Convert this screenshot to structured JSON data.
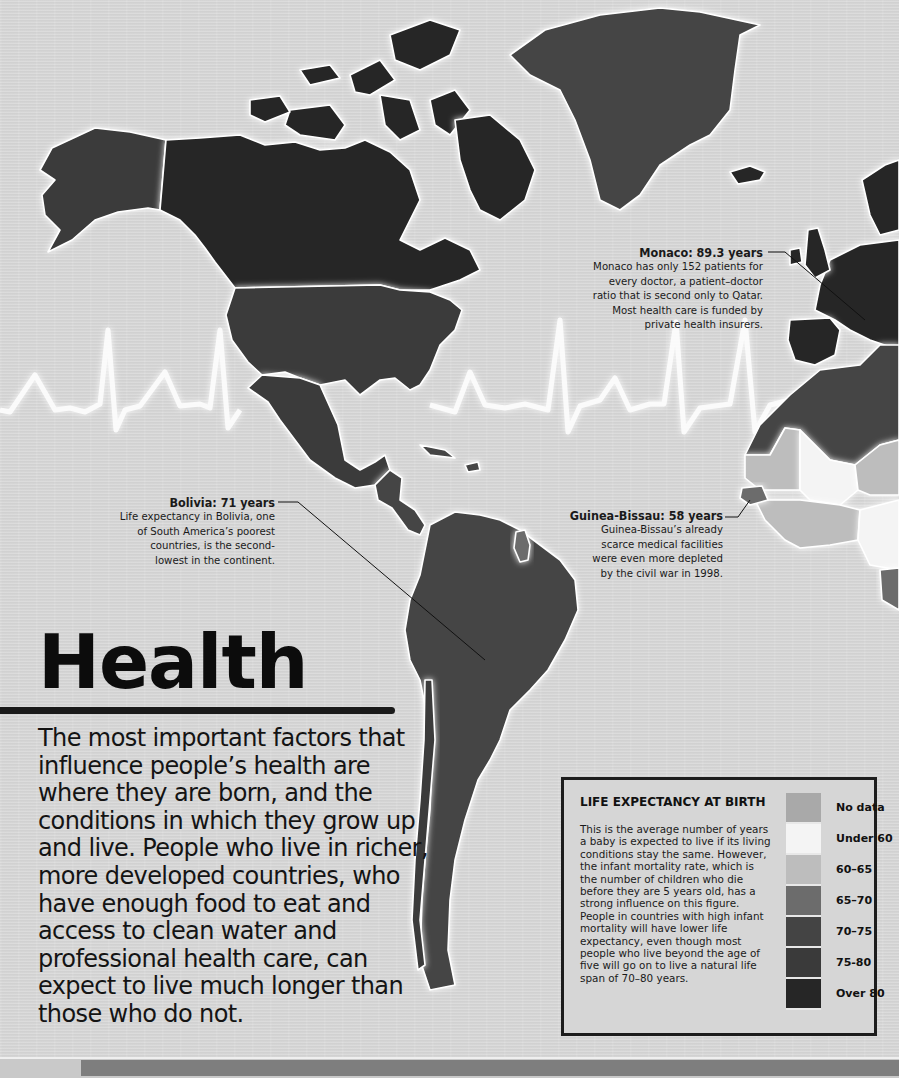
{
  "page": {
    "title": "Health",
    "intro": "The most important factors that influence people’s health are where they are born, and the conditions in which they grow up and live. People who live in richer, more developed countries, who have enough food to eat and access to clean water and professional health care, can expect to live much longer than those who do not."
  },
  "annotations": [
    {
      "id": "monaco",
      "title": "Monaco: 89.3 years",
      "lines": [
        "Monaco has only 152 patients for",
        "every doctor, a patient–doctor",
        "ratio that is second only to Qatar.",
        "Most health care is funded by",
        "private health insurers."
      ]
    },
    {
      "id": "bolivia",
      "title": "Bolivia: 71 years",
      "lines": [
        "Life expectancy in Bolivia, one",
        "of South America’s poorest",
        "countries, is the second-",
        "lowest in the continent."
      ]
    },
    {
      "id": "guinea-bissau",
      "title": "Guinea-Bissau: 58 years",
      "lines": [
        "Guinea-Bissau’s already",
        "scarce medical facilities",
        "were even more depleted",
        "by the civil war in 1998."
      ]
    }
  ],
  "legend": {
    "title": "LIFE EXPECTANCY AT BIRTH",
    "description": "This is the average number of years a baby is expected to live if its living conditions stay the same. However, the infant mortality rate, which is the number of children who die before they are 5 years old, has a strong influence on this figure. People in countries with high infant mortality will have lower life expectancy, even though most people who live beyond the age of five will go on to live a natural life span of 70–80 years.",
    "keys": [
      {
        "label": "No data",
        "color": "#a9a9a9"
      },
      {
        "label": "Under 60",
        "color": "#f4f4f4"
      },
      {
        "label": "60–65",
        "color": "#bdbdbd"
      },
      {
        "label": "65–70",
        "color": "#6c6c6c"
      },
      {
        "label": "70–75",
        "color": "#444444"
      },
      {
        "label": "75-80",
        "color": "#3a3a3a"
      },
      {
        "label": "Over 80",
        "color": "#262626"
      }
    ]
  },
  "map": {
    "regions": [
      {
        "name": "Alaska (USA)",
        "class": "75-80"
      },
      {
        "name": "Canada",
        "class": "Over 80"
      },
      {
        "name": "Greenland",
        "class": "70-75"
      },
      {
        "name": "Iceland",
        "class": "Over 80"
      },
      {
        "name": "USA",
        "class": "75-80"
      },
      {
        "name": "Mexico",
        "class": "75-80"
      },
      {
        "name": "Central America",
        "class": "70-75"
      },
      {
        "name": "South America",
        "class": "70-75"
      },
      {
        "name": "Guyana",
        "class": "65-70"
      },
      {
        "name": "Western Europe",
        "class": "Over 80"
      },
      {
        "name": "North Africa",
        "class": "70-75"
      },
      {
        "name": "Sahel / West Africa",
        "class": "Under 60 / 60-65"
      },
      {
        "name": "Guinea-Bissau",
        "class": "Under 60"
      }
    ]
  }
}
